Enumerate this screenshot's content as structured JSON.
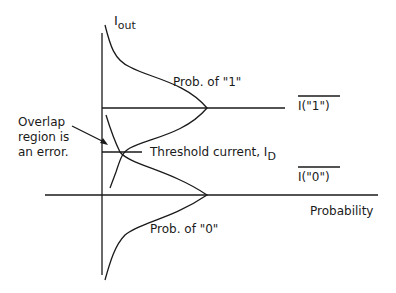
{
  "diagram": {
    "y_axis_label": {
      "main": "I",
      "sub": "out"
    },
    "x_axis_label": "Probability",
    "curve_one_label": "Prob. of \"1\"",
    "curve_zero_label": "Prob. of \"0\"",
    "level_one_label": "I(\"1\")",
    "level_zero_label": "I(\"0\")",
    "threshold_label": {
      "main": "Threshold current, I",
      "sub": "D"
    },
    "overlap_note": [
      "Overlap",
      "region is",
      "an error."
    ],
    "colors": {
      "line": "#1a1a1a",
      "background": "#ffffff"
    }
  }
}
